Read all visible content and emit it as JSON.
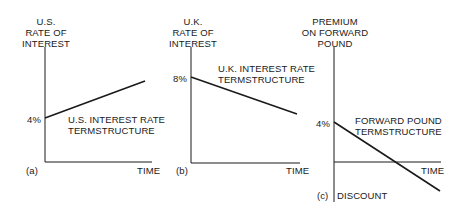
{
  "panels": [
    {
      "id": "a",
      "tag": "(a)",
      "y_title": [
        "U.S.",
        "RATE OF",
        "INTEREST"
      ],
      "y_tick": "4%",
      "x_label": "TIME",
      "curve_label": [
        "U.S. INTEREST RATE",
        "TERMSTRUCTURE"
      ]
    },
    {
      "id": "b",
      "tag": "(b)",
      "y_title": [
        "U.K.",
        "RATE OF",
        "INTEREST"
      ],
      "y_tick": "8%",
      "x_label": "TIME",
      "curve_label": [
        "U.K. INTEREST RATE",
        "TERMSTRUCTURE"
      ]
    },
    {
      "id": "c",
      "tag": "(c)",
      "y_title": [
        "PREMIUM",
        "ON FORWARD",
        "POUND"
      ],
      "y_tick": "4%",
      "x_label": "TIME",
      "y_bottom_label": "DISCOUNT",
      "curve_label": [
        "FORWARD POUND",
        "TERMSTRUCTURE"
      ]
    }
  ],
  "colors": {
    "line": "#1a1a1a",
    "background": "#ffffff"
  }
}
